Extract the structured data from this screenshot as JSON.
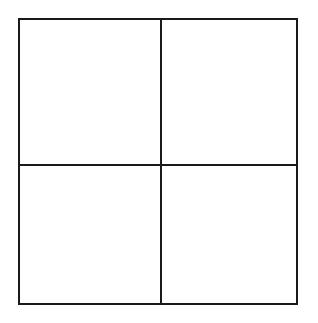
{
  "diagram": {
    "type": "2x2-grid",
    "rows": 2,
    "columns": 2,
    "line_color": "#1a1a1a",
    "background_color": "#ffffff",
    "cells": [
      {
        "position": "top-left",
        "label": ""
      },
      {
        "position": "top-right",
        "label": ""
      },
      {
        "position": "bottom-left",
        "label": ""
      },
      {
        "position": "bottom-right",
        "label": ""
      }
    ]
  }
}
